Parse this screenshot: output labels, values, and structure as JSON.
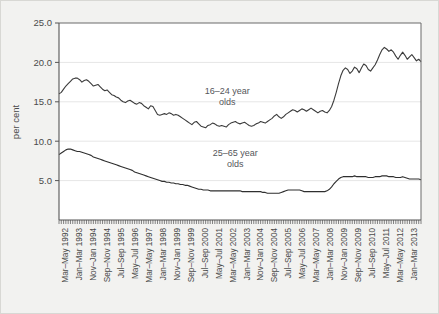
{
  "chart_data": {
    "type": "line",
    "title": "",
    "xlabel": "",
    "ylabel": "per cent",
    "ylim": [
      0,
      25
    ],
    "yticks": [
      5.0,
      10.0,
      15.0,
      20.0,
      25.0
    ],
    "ytick_labels": [
      "5.0",
      "10.0",
      "15.0",
      "20.0",
      "25.0"
    ],
    "grid": true,
    "legend": "inline-annotations",
    "xtick_labels": [
      "Mar–May 1992",
      "Jan–Mar 1993",
      "Nov–Jan 1994",
      "Sep–Nov 1994",
      "Jul–Sep 1995",
      "May–Jul 1996",
      "Mar–May 1997",
      "Jan–Mar 1998",
      "Nov–Jan 1999",
      "Sep–Nov 1999",
      "Jul–Sep 2000",
      "May–Jul 2001",
      "Mar–May 2002",
      "Jan–Mar 2003",
      "Nov–Jan 2004",
      "Sep–Nov 2004",
      "Jul–Sep 2005",
      "May–Jul 2006",
      "Mar–May 2007",
      "Jan–Mar 2008",
      "Nov–Jan 2009",
      "Sep–Nov 2009",
      "Jul–Sep 2010",
      "May–Jul 2011",
      "Mar–May 2012",
      "Jan–Mar 2013"
    ],
    "annotations": [
      {
        "name": "series-label-16-24",
        "line1": "16–24 year",
        "line2": "olds",
        "x_frac": 0.465,
        "y_value": 16.0
      },
      {
        "name": "series-label-25-65",
        "line1": "25–65 year",
        "line2": "olds",
        "x_frac": 0.487,
        "y_value": 8.1
      }
    ],
    "series": [
      {
        "name": "16–24 year olds",
        "color": "#3b3b3b",
        "values": [
          16.0,
          16.2,
          16.6,
          17.0,
          17.3,
          17.6,
          17.9,
          18.0,
          18.0,
          17.8,
          17.5,
          17.7,
          17.8,
          17.6,
          17.3,
          17.0,
          17.1,
          17.2,
          16.9,
          16.6,
          16.4,
          16.5,
          16.2,
          15.9,
          15.8,
          15.6,
          15.5,
          15.2,
          15.0,
          14.9,
          15.1,
          15.2,
          15.0,
          14.8,
          14.7,
          14.9,
          14.8,
          14.5,
          14.3,
          14.1,
          14.5,
          14.4,
          13.9,
          13.4,
          13.3,
          13.4,
          13.5,
          13.4,
          13.6,
          13.5,
          13.3,
          13.4,
          13.3,
          13.1,
          12.9,
          12.7,
          12.5,
          12.3,
          12.1,
          12.4,
          12.5,
          12.2,
          11.9,
          11.8,
          11.7,
          12.0,
          12.1,
          12.3,
          12.2,
          12.0,
          11.9,
          12.0,
          11.9,
          11.8,
          12.1,
          12.3,
          12.4,
          12.5,
          12.3,
          12.2,
          12.3,
          12.4,
          12.2,
          12.0,
          11.9,
          12.0,
          12.2,
          12.3,
          12.5,
          12.4,
          12.3,
          12.5,
          12.7,
          12.9,
          13.2,
          13.4,
          13.1,
          12.9,
          13.1,
          13.4,
          13.6,
          13.8,
          14.0,
          13.9,
          13.7,
          13.9,
          14.1,
          14.0,
          13.8,
          14.0,
          14.2,
          14.0,
          13.8,
          13.6,
          13.8,
          13.9,
          13.7,
          13.6,
          13.9,
          14.4,
          15.2,
          16.2,
          17.3,
          18.3,
          19.0,
          19.3,
          19.1,
          18.6,
          18.9,
          19.4,
          19.2,
          18.7,
          19.3,
          19.8,
          19.6,
          19.1,
          18.9,
          19.3,
          19.7,
          20.3,
          21.0,
          21.6,
          21.9,
          21.7,
          21.4,
          21.6,
          21.3,
          20.8,
          20.4,
          20.9,
          21.3,
          20.9,
          20.4,
          20.7,
          21.0,
          20.6,
          20.2,
          20.4,
          20.1
        ]
      },
      {
        "name": "25–65 year olds",
        "color": "#2f2f2f",
        "values": [
          8.3,
          8.5,
          8.7,
          8.9,
          9.0,
          9.0,
          8.9,
          8.8,
          8.7,
          8.7,
          8.6,
          8.5,
          8.4,
          8.3,
          8.2,
          8.0,
          7.9,
          7.8,
          7.7,
          7.6,
          7.5,
          7.4,
          7.3,
          7.2,
          7.1,
          7.0,
          6.9,
          6.8,
          6.7,
          6.6,
          6.5,
          6.4,
          6.3,
          6.1,
          6.0,
          5.9,
          5.8,
          5.7,
          5.6,
          5.5,
          5.4,
          5.3,
          5.2,
          5.1,
          5.0,
          4.9,
          4.9,
          4.8,
          4.8,
          4.7,
          4.7,
          4.6,
          4.6,
          4.5,
          4.5,
          4.4,
          4.4,
          4.3,
          4.2,
          4.1,
          4.0,
          3.9,
          3.9,
          3.8,
          3.8,
          3.8,
          3.7,
          3.7,
          3.7,
          3.7,
          3.7,
          3.7,
          3.7,
          3.7,
          3.7,
          3.7,
          3.7,
          3.7,
          3.7,
          3.7,
          3.6,
          3.6,
          3.6,
          3.6,
          3.6,
          3.6,
          3.6,
          3.6,
          3.6,
          3.5,
          3.5,
          3.4,
          3.4,
          3.4,
          3.4,
          3.4,
          3.4,
          3.5,
          3.6,
          3.7,
          3.8,
          3.8,
          3.8,
          3.8,
          3.8,
          3.8,
          3.7,
          3.6,
          3.6,
          3.6,
          3.6,
          3.6,
          3.6,
          3.6,
          3.6,
          3.6,
          3.6,
          3.7,
          3.9,
          4.2,
          4.6,
          4.9,
          5.2,
          5.4,
          5.5,
          5.5,
          5.5,
          5.5,
          5.5,
          5.6,
          5.5,
          5.5,
          5.5,
          5.5,
          5.5,
          5.4,
          5.4,
          5.4,
          5.5,
          5.5,
          5.5,
          5.6,
          5.6,
          5.6,
          5.5,
          5.5,
          5.5,
          5.4,
          5.4,
          5.4,
          5.5,
          5.4,
          5.3,
          5.2,
          5.2,
          5.2,
          5.2,
          5.2,
          5.1
        ]
      }
    ]
  }
}
